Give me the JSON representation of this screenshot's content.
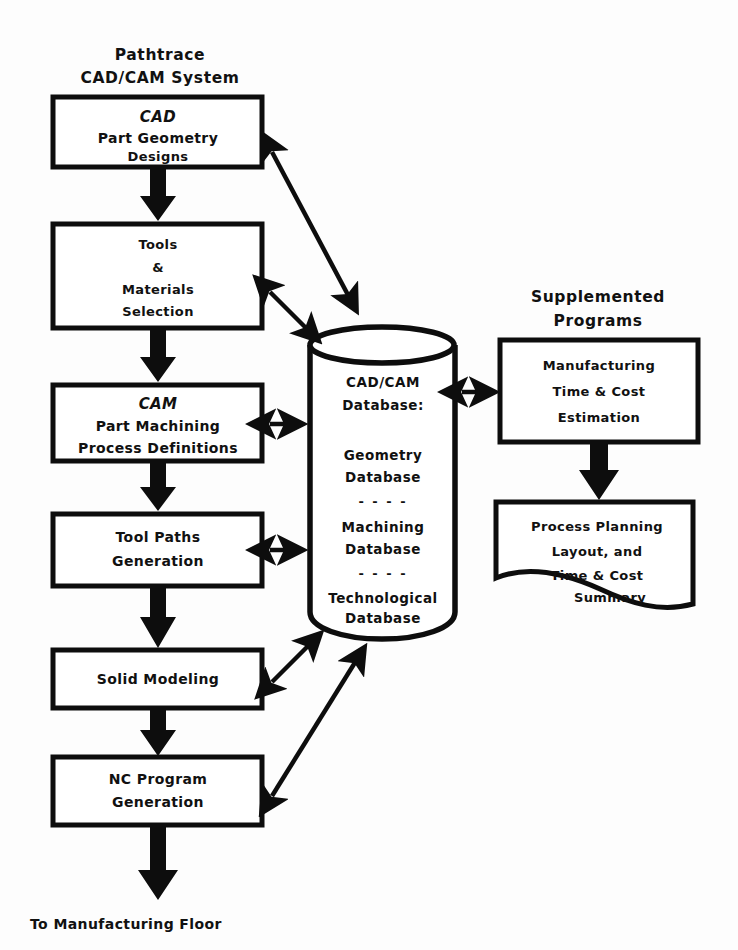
{
  "figure": {
    "kind": "flowchart-diagram",
    "ink_color": "#0d0d0d",
    "paper_color": "#fdfdfd"
  },
  "left_column": {
    "heading_line1": "Pathtrace",
    "heading_line2": "CAD/CAM System",
    "boxes": [
      {
        "id": "cad",
        "line1": "CAD",
        "line2": "Part Geometry",
        "line3": "Designs"
      },
      {
        "id": "tools",
        "line1": "Tools",
        "line2": "&",
        "line3": "Materials",
        "line4": "Selection"
      },
      {
        "id": "cam",
        "line1": "CAM",
        "line2": "Part Machining",
        "line3": "Process Definitions"
      },
      {
        "id": "toolpaths",
        "line1": "Tool Paths",
        "line2": "Generation"
      },
      {
        "id": "solid",
        "line1": "Solid Modeling"
      },
      {
        "id": "nc",
        "line1": "NC Program",
        "line2": "Generation"
      }
    ],
    "footer": "To Manufacturing Floor"
  },
  "database": {
    "title_line1": "CAD/CAM",
    "title_line2": "Database:",
    "entries": [
      {
        "line1": "Geometry",
        "line2": "Database"
      },
      {
        "line1": "Machining",
        "line2": "Database"
      },
      {
        "line1": "Technological",
        "line2": "Database"
      }
    ],
    "separator": "- - - -"
  },
  "right_column": {
    "heading_line1": "Supplemented",
    "heading_line2": "Programs",
    "boxes": [
      {
        "id": "mfg-estimation",
        "line1": "Manufacturing",
        "line2": "Time & Cost",
        "line3": "Estimation"
      },
      {
        "id": "process-planning",
        "line1": "Process Planning",
        "line2": "Layout, and",
        "line3": "Time & Cost",
        "line4": "Summary"
      }
    ]
  }
}
